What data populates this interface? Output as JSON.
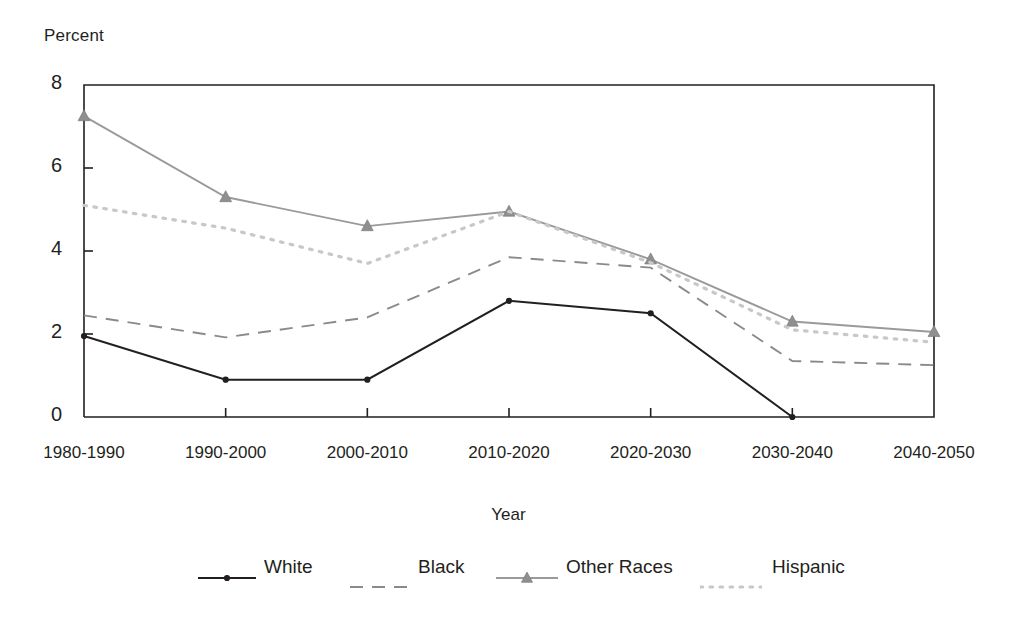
{
  "chart_data": {
    "type": "line",
    "title": "",
    "xlabel": "Year",
    "ylabel": "Percent",
    "categories": [
      "1980-1990",
      "1990-2000",
      "2000-2010",
      "2010-2020",
      "2020-2030",
      "2030-2040",
      "2040-2050"
    ],
    "ylim": [
      0,
      8
    ],
    "yticks": [
      0,
      2,
      4,
      6,
      8
    ],
    "grid": false,
    "legend_position": "bottom",
    "series": [
      {
        "name": "White",
        "style": "solid",
        "color": "#231f20",
        "marker": "dot",
        "values": [
          1.95,
          0.9,
          0.9,
          2.8,
          2.5,
          0.0,
          null
        ]
      },
      {
        "name": "Black",
        "style": "dashed",
        "color": "#8a8a8a",
        "marker": "none",
        "values": [
          2.45,
          1.92,
          2.4,
          3.85,
          3.6,
          1.35,
          1.25
        ]
      },
      {
        "name": "Other Races",
        "style": "solid",
        "color": "#9a9a9a",
        "marker": "triangle",
        "values": [
          7.25,
          5.3,
          4.6,
          4.95,
          3.8,
          2.3,
          2.05
        ]
      },
      {
        "name": "Hispanic",
        "style": "dotted",
        "color": "#c8c8c8",
        "marker": "none",
        "values": [
          5.1,
          4.55,
          3.7,
          4.95,
          3.72,
          2.1,
          1.8
        ]
      }
    ]
  },
  "axes": {
    "ylabel_text": "Percent",
    "xlabel_text": "Year",
    "ytick_labels": [
      "8",
      "6",
      "4",
      "2",
      "0"
    ],
    "xtick_labels": [
      "1980-1990",
      "1990-2000",
      "2000-2010",
      "2010-2020",
      "2020-2030",
      "2030-2040",
      "2040-2050"
    ]
  },
  "legend": {
    "items": [
      {
        "label": "White"
      },
      {
        "label": "Black"
      },
      {
        "label": "Other Races"
      },
      {
        "label": "Hispanic"
      }
    ]
  },
  "colors": {
    "axis": "#231f20",
    "white_series": "#231f20",
    "black_series": "#8a8a8a",
    "other_races_series": "#9a9a9a",
    "hispanic_series": "#c8c8c8",
    "background": "#ffffff"
  }
}
